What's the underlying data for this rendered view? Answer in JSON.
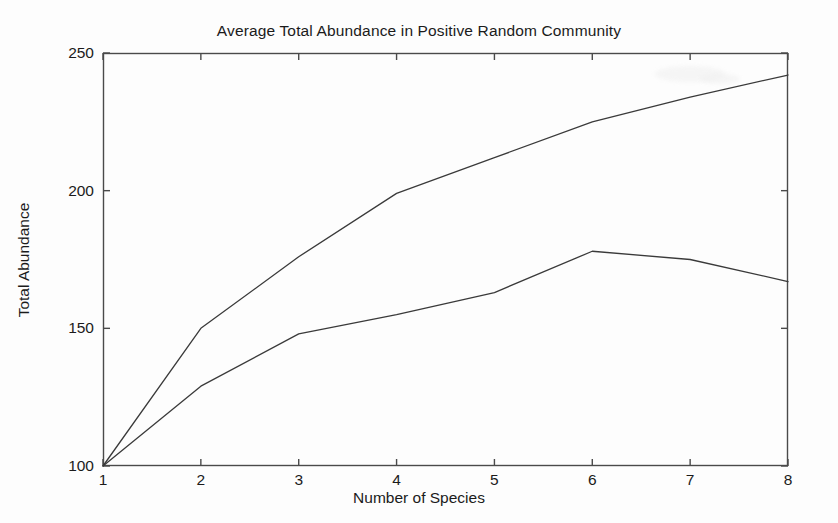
{
  "chart_data": {
    "type": "line",
    "title": "Average Total Abundance in Positive Random Community",
    "xlabel": "Number of Species",
    "ylabel": "Total Abundance",
    "x": [
      1,
      2,
      3,
      4,
      5,
      6,
      7,
      8
    ],
    "xlim": [
      1,
      8
    ],
    "ylim": [
      100,
      250
    ],
    "xticks": [
      "1",
      "2",
      "3",
      "4",
      "5",
      "6",
      "7",
      "8"
    ],
    "yticks": [
      "100",
      "150",
      "200",
      "250"
    ],
    "grid": false,
    "legend": null,
    "line_color": "#3a3a3a",
    "series": [
      {
        "name": "upper-curve",
        "values": [
          100,
          150,
          176,
          199,
          212,
          225,
          234,
          242
        ]
      },
      {
        "name": "lower-curve",
        "values": [
          100,
          129,
          148,
          155,
          163,
          178,
          175,
          167
        ]
      }
    ]
  },
  "axes": {
    "box_color": "#4a4a4a",
    "tick_color": "#4a4a4a"
  }
}
